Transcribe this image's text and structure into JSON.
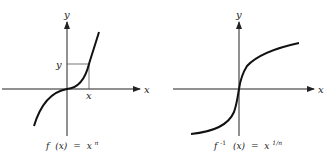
{
  "left_graph": {
    "y_axis_label": "y",
    "x_axis_label": "x",
    "point_x_label": "x",
    "point_y_label": "y",
    "caption_func": "f",
    "caption_arg": "(x)",
    "caption_eq": "=",
    "caption_base": "x",
    "caption_exp": "n",
    "curve": "f(x) = x^n (odd power, cubic-like)"
  },
  "right_graph": {
    "y_axis_label": "y",
    "x_axis_label": "x",
    "caption_func": "f",
    "caption_sup": "-1",
    "caption_arg": "(x)",
    "caption_eq": "=",
    "caption_base": "x",
    "caption_exp": "1/n",
    "curve": "f^-1(x) = x^(1/n) (odd root)"
  },
  "colors": {
    "ink": "#222222",
    "guide": "#555555",
    "background": "#ffffff"
  }
}
